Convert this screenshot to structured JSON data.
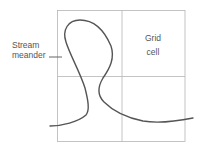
{
  "diagram": {
    "labels": {
      "stream_line1": "Stream",
      "stream_line2": "meander",
      "grid_line1": "Grid",
      "grid_line2": "cell"
    },
    "grid": {
      "rows": 2,
      "cols": 2,
      "line_color": "#b5b5b5"
    },
    "stream": {
      "color": "#555555"
    }
  }
}
